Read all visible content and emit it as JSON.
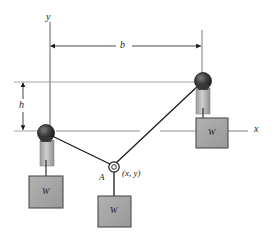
{
  "figure": {
    "type": "statics-pulley-diagram",
    "axes": {
      "y_axis_label": "y",
      "x_axis_label": "x"
    },
    "dimensions": [
      {
        "name": "span",
        "label": "b",
        "orientation": "horizontal"
      },
      {
        "name": "height",
        "label": "h",
        "orientation": "vertical"
      }
    ],
    "node": {
      "point_label": "A",
      "coordinate_label": "(x, y)"
    },
    "weights": [
      {
        "name": "left-weight",
        "label": "W"
      },
      {
        "name": "center-weight",
        "label": "W"
      },
      {
        "name": "right-weight",
        "label": "W"
      }
    ],
    "colors": {
      "line": "#1a1a1a",
      "extension_line": "#8c8c8c",
      "block_fill": "#a3a3a3",
      "block_stroke": "#4d4d4d",
      "pulley_dark": "#2e2e2e",
      "pulley_mid": "#595959",
      "shaft_fill": "#b0b0b0",
      "background": "#ffffff"
    }
  }
}
